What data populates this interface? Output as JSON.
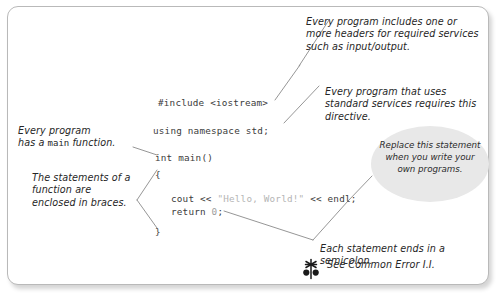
{
  "figure": {
    "panel_border_color": "#b9b9b9",
    "callout_fill_color": "#e8e8e8",
    "code_text_color": "#3b3b3b",
    "string_literal_color": "#b5b5b5"
  },
  "code": {
    "lines": [
      {
        "id": "include",
        "text": "#include <iostream>"
      },
      {
        "id": "using",
        "text": "using namespace std;"
      },
      {
        "id": "main",
        "text": "int main()"
      },
      {
        "id": "open",
        "text": "{"
      },
      {
        "id": "cout_pre",
        "text": "cout << "
      },
      {
        "id": "cout_str",
        "text": "\"Hello, World!\""
      },
      {
        "id": "cout_post",
        "text": " << endl;"
      },
      {
        "id": "ret_pre",
        "text": "return "
      },
      {
        "id": "ret_num",
        "text": "0"
      },
      {
        "id": "ret_post",
        "text": ";"
      },
      {
        "id": "close",
        "text": "}"
      }
    ]
  },
  "annotations": {
    "headers": "Every program includes one or more headers for required services such as input/output.",
    "directive": "Every program that uses standard services requires this directive.",
    "main_function_part1": "Every program",
    "main_function_part2": "has a ",
    "main_function_mono": "main",
    "main_function_part3": " function.",
    "braces": "The statements of a function are enclosed in braces.",
    "semicolon": "Each statement ends in a semicolon.",
    "common_error": "See Common Error I.I.",
    "replace_callout": "Replace this statement when you write your own programs."
  },
  "icons": {
    "common_error": "common-error-flower-icon"
  }
}
